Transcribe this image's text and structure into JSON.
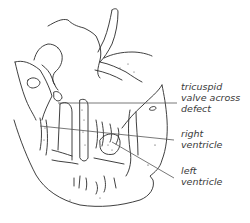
{
  "figure": {
    "type": "anatomical line drawing (heart cross-section)",
    "line_color": "#2a2a2a",
    "leader_color": "#555555"
  },
  "labels": [
    {
      "id": "tricuspid",
      "lines": [
        "tricuspid",
        "valve across",
        "defect"
      ]
    },
    {
      "id": "right-ventricle",
      "lines": [
        "right",
        "ventricle"
      ]
    },
    {
      "id": "left-ventricle",
      "lines": [
        "left",
        "ventricle"
      ]
    }
  ]
}
